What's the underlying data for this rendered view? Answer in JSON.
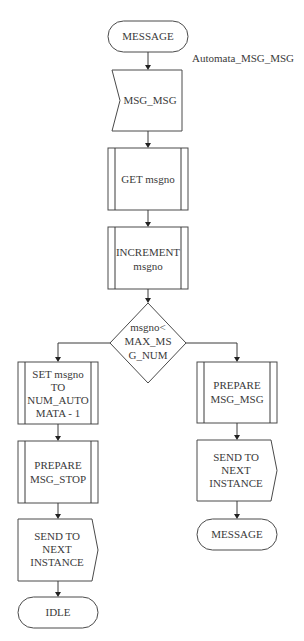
{
  "diagram": {
    "title_label": "Automata_MSG_MSG",
    "nodes": {
      "start": {
        "type": "terminal",
        "label": "MESSAGE"
      },
      "receive": {
        "type": "receive",
        "label": "MSG_MSG"
      },
      "get": {
        "type": "process",
        "label": "GET msgno"
      },
      "increment": {
        "type": "process",
        "lines": [
          "INCREMENT",
          "msgno"
        ]
      },
      "decision": {
        "type": "decision",
        "lines": [
          "msgno<",
          "MAX_MS",
          "G_NUM"
        ]
      },
      "set": {
        "type": "process",
        "lines": [
          "SET msgno",
          "TO",
          "NUM_AUTO",
          "MATA - 1"
        ]
      },
      "prepare_stop": {
        "type": "process",
        "lines": [
          "PREPARE",
          "MSG_STOP"
        ]
      },
      "send_left": {
        "type": "send",
        "lines": [
          "SEND TO",
          "NEXT",
          "INSTANCE"
        ]
      },
      "idle": {
        "type": "terminal",
        "label": "IDLE"
      },
      "prepare_msg": {
        "type": "process",
        "lines": [
          "PREPARE",
          "MSG_MSG"
        ]
      },
      "send_right": {
        "type": "send",
        "lines": [
          "SEND TO",
          "NEXT",
          "INSTANCE"
        ]
      },
      "end_message": {
        "type": "terminal",
        "label": "MESSAGE"
      }
    },
    "colors": {
      "stroke": "#4a4a4a",
      "text": "#3a3a3a",
      "background": "#ffffff"
    }
  }
}
